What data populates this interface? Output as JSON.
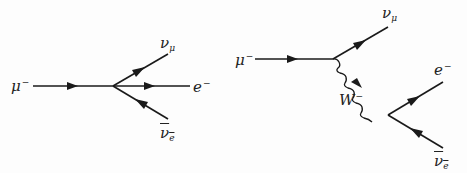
{
  "diagrams": [
    {
      "name": "four-fermion-muon-decay",
      "labels": {
        "incoming": {
          "base": "μ",
          "sup": "−"
        },
        "out_top": {
          "base": "ν",
          "sub": "μ"
        },
        "out_mid": {
          "base": "e",
          "sup": "−"
        },
        "out_bottom": {
          "base": "ν",
          "sub": "e",
          "overline": true
        }
      }
    },
    {
      "name": "w-boson-muon-decay",
      "labels": {
        "incoming": {
          "base": "μ",
          "sup": "−"
        },
        "out_top": {
          "base": "ν",
          "sub": "μ"
        },
        "boson": {
          "base": "W",
          "sup": "−"
        },
        "out_electron": {
          "base": "e",
          "sup": "−"
        },
        "out_antineutrino": {
          "base": "ν",
          "sub": "e",
          "overline": true
        }
      }
    }
  ],
  "colors": {
    "line": "#1a1a1a",
    "background": "#fdfdfd"
  }
}
